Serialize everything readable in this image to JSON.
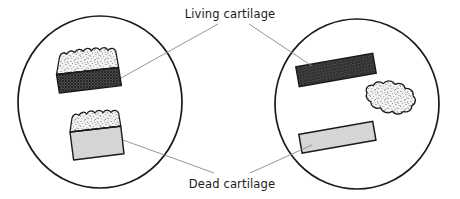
{
  "figure": {
    "background_color": "#ffffff",
    "width": 460,
    "height": 199
  },
  "labels": {
    "living": "Living cartilage",
    "dead": "Dead cartilage"
  },
  "colors": {
    "outline": "#1a1a1a",
    "leader_line": "#8a8a8a",
    "living_cartilage_fill": "#5a5a5a",
    "dead_cartilage_fill": "#d4d4d4",
    "bone_stipple_fill": "#f2f2f2",
    "stipple_dot": "#4d4d4d",
    "text": "#1a1a1a"
  },
  "panels": [
    {
      "name": "left-panel",
      "center_x": 100,
      "center_y": 102,
      "radius_x": 82,
      "radius_y": 86,
      "specimens": [
        {
          "name": "left-upper-specimen",
          "type": "bone-with-living-cartilage",
          "layers": [
            "bone-stipple",
            "living-cartilage-hatch"
          ]
        },
        {
          "name": "left-lower-specimen",
          "type": "bone-with-dead-cartilage",
          "layers": [
            "bone-stipple",
            "dead-cartilage-solid"
          ]
        }
      ]
    },
    {
      "name": "right-panel",
      "center_x": 357,
      "center_y": 104,
      "radius_x": 82,
      "radius_y": 85,
      "specimens": [
        {
          "name": "right-upper-strip",
          "type": "living-cartilage-strip",
          "layers": [
            "living-cartilage-hatch"
          ]
        },
        {
          "name": "right-lower-strip",
          "type": "dead-cartilage-strip",
          "layers": [
            "dead-cartilage-solid"
          ]
        },
        {
          "name": "right-bone-fragment",
          "type": "bone-fragment-blob",
          "layers": [
            "bone-stipple"
          ]
        }
      ]
    }
  ],
  "leader_lines": [
    {
      "name": "leader-living-left",
      "from_label": "living",
      "to_panel": "left-panel"
    },
    {
      "name": "leader-living-right",
      "from_label": "living",
      "to_panel": "right-panel"
    },
    {
      "name": "leader-dead-left",
      "from_label": "dead",
      "to_panel": "left-panel"
    },
    {
      "name": "leader-dead-right",
      "from_label": "dead",
      "to_panel": "right-panel"
    }
  ]
}
